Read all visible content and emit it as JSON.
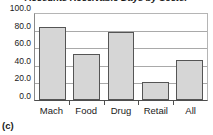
{
  "chart_data": {
    "type": "bar",
    "title": "Accounts Receivable Days by Sector",
    "xlabel": "",
    "ylabel": "",
    "categories": [
      "Mach",
      "Food",
      "Drug",
      "Retail",
      "All"
    ],
    "values": [
      85,
      53,
      79,
      21,
      46
    ],
    "series": [
      {
        "name": "Accounts Receivable Days",
        "values": [
          85,
          53,
          79,
          21,
          46
        ]
      }
    ],
    "ylim": [
      0.0,
      100.0
    ],
    "yticks": [
      "0.0",
      "20.0",
      "40.0",
      "60.0",
      "80.0",
      "100.0"
    ],
    "ytick_values": [
      0,
      20,
      40,
      60,
      80,
      100
    ],
    "grid": "horizontal",
    "legend": "none",
    "bar_fill_color": "#d6d6d6",
    "bar_border_color": "#555555",
    "gridline_color": "#a9a9a9",
    "axis_color": "#4d4d4d",
    "text_color": "#1a1a1a"
  },
  "figure": {
    "panel_caption": "(c)"
  }
}
